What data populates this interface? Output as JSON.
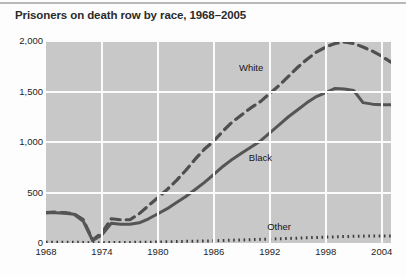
{
  "figure": {
    "title": "Prisoners on death row by race, 1968–2005"
  },
  "chart_data": {
    "type": "line",
    "title": "Prisoners on death row by race, 1968–2005",
    "xlabel": "",
    "ylabel": "",
    "xlim": [
      1968,
      2005
    ],
    "ylim": [
      0,
      2000
    ],
    "grid": true,
    "legend_position": "inline-annotations",
    "xticks": [
      1968,
      1974,
      1980,
      1986,
      1992,
      1998,
      2004
    ],
    "xtick_labels": [
      "1968",
      "1974",
      "1980",
      "1986",
      "1992",
      "1998",
      "2004"
    ],
    "yticks": [
      0,
      500,
      1000,
      1500,
      2000
    ],
    "ytick_labels": [
      "0",
      "500",
      "1,000",
      "1,500",
      "2,000"
    ],
    "x": [
      1968,
      1969,
      1970,
      1971,
      1972,
      1973,
      1974,
      1975,
      1976,
      1977,
      1978,
      1979,
      1980,
      1981,
      1982,
      1983,
      1984,
      1985,
      1986,
      1987,
      1988,
      1989,
      1990,
      1991,
      1992,
      1993,
      1994,
      1995,
      1996,
      1997,
      1998,
      1999,
      2000,
      2001,
      2002,
      2003,
      2004,
      2005
    ],
    "series": [
      {
        "name": "White",
        "style": "dashed",
        "color": "#4f4f4f",
        "values": [
          300,
          305,
          300,
          290,
          230,
          30,
          100,
          240,
          230,
          230,
          290,
          370,
          450,
          530,
          620,
          720,
          830,
          930,
          1010,
          1110,
          1200,
          1270,
          1340,
          1400,
          1480,
          1560,
          1650,
          1740,
          1820,
          1890,
          1940,
          1975,
          1990,
          1975,
          1940,
          1900,
          1850,
          1790
        ]
      },
      {
        "name": "Black",
        "style": "solid",
        "color": "#555555",
        "values": [
          300,
          300,
          295,
          285,
          215,
          25,
          80,
          195,
          185,
          185,
          200,
          240,
          290,
          340,
          400,
          460,
          530,
          600,
          680,
          760,
          830,
          890,
          950,
          1010,
          1090,
          1170,
          1250,
          1320,
          1390,
          1450,
          1490,
          1530,
          1525,
          1510,
          1390,
          1375,
          1370,
          1370
        ]
      },
      {
        "name": "Other",
        "style": "dotted",
        "color": "#3d3d3d",
        "values": [
          8,
          8,
          8,
          8,
          6,
          2,
          3,
          6,
          6,
          6,
          7,
          8,
          10,
          12,
          14,
          16,
          18,
          20,
          22,
          25,
          28,
          30,
          33,
          36,
          39,
          42,
          45,
          48,
          52,
          55,
          58,
          61,
          64,
          66,
          68,
          69,
          70,
          68
        ]
      }
    ],
    "annotations": [
      {
        "text": "White",
        "x": 1990,
        "y": 1730
      },
      {
        "text": "Black",
        "x": 1991,
        "y": 840
      },
      {
        "text": "Other",
        "x": 1993,
        "y": 160
      }
    ]
  }
}
